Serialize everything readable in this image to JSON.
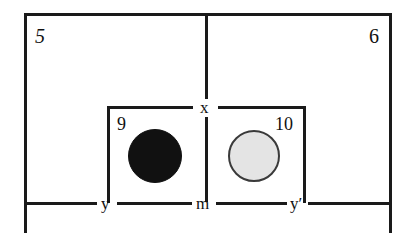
{
  "figure": {
    "title": "",
    "background_color": "#ffffff",
    "line_color": "#1a1a1a",
    "width": 416,
    "height": 243
  },
  "region_labels": {
    "outer_left": "5",
    "outer_right": "6",
    "inner_left": "9",
    "inner_right": "10"
  },
  "axis_labels": {
    "top_center": "x",
    "bottom_left": "y",
    "bottom_center": "m",
    "bottom_right": "y′"
  },
  "objects": [
    {
      "name": "black-disc",
      "label_ref": "9",
      "fill": "#111111",
      "stroke": "#111111",
      "cx": 155,
      "cy": 156,
      "r": 27
    },
    {
      "name": "gray-disc",
      "label_ref": "10",
      "fill": "#e4e4e4",
      "stroke": "#3a3a3a",
      "cx": 254,
      "cy": 156,
      "r": 26
    }
  ],
  "segments": {
    "outer_top": "top border of outer rectangle",
    "outer_bottom": "bottom baseline through y, m, y′",
    "outer_left": "left border of outer rectangle",
    "outer_right": "right border of outer rectangle",
    "median_vertical": "vertical line from top border down to x",
    "center_vertical": "vertical line from x down to m",
    "inner_box": "inner rectangle enclosing the two discs"
  }
}
